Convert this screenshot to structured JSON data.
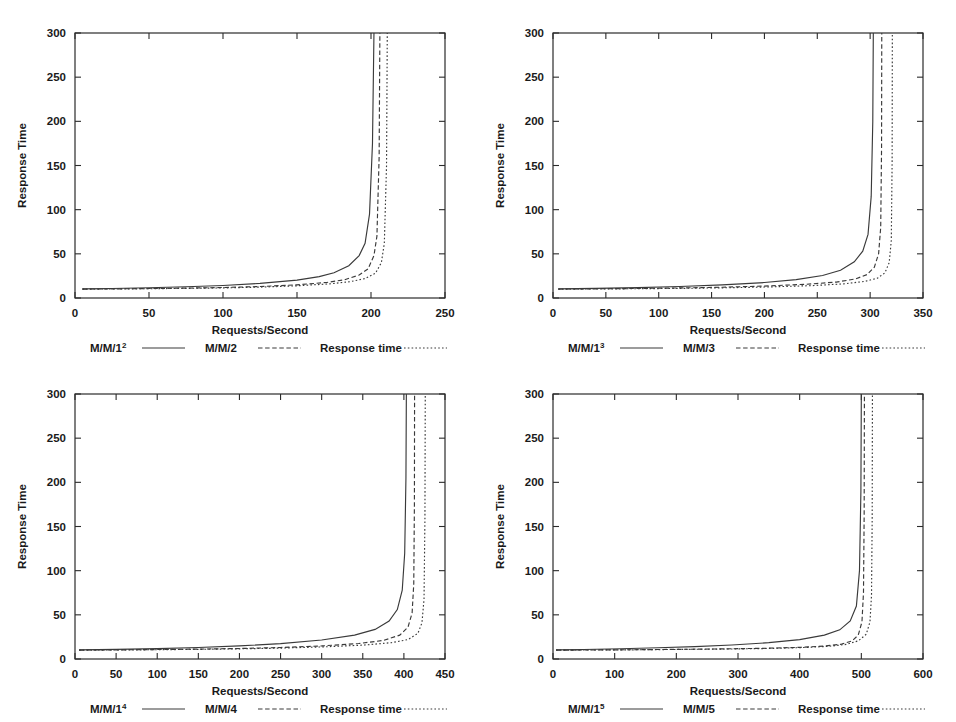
{
  "figure": {
    "panel_count": 4,
    "background": "#ffffff",
    "ink_color": "#2b2b2b"
  },
  "chart_data": [
    {
      "type": "line",
      "title": "",
      "panel_id": "panel-1",
      "xlabel": "Requests/Second",
      "ylabel": "Response Time",
      "xlim": [
        0,
        250
      ],
      "ylim": [
        0,
        300
      ],
      "xticks": [
        0,
        50,
        100,
        150,
        200,
        250
      ],
      "yticks": [
        0,
        50,
        100,
        150,
        200,
        250,
        300
      ],
      "grid": false,
      "legend_position": "below",
      "series": [
        {
          "name": "M/M/1",
          "superscript": "2",
          "label": "M/M/1²",
          "style": "solid",
          "asymptote_x": 202,
          "baseline_y": 10,
          "x": [
            5,
            25,
            50,
            75,
            100,
            125,
            150,
            165,
            175,
            185,
            192,
            196,
            199,
            201,
            202
          ],
          "y": [
            10.3,
            10.8,
            11.6,
            12.7,
            14.2,
            16.5,
            20.3,
            24.2,
            28.5,
            36.5,
            48.0,
            62.0,
            95.0,
            175.0,
            300.0
          ]
        },
        {
          "name": "M/M/2",
          "superscript": "",
          "label": "M/M/2",
          "style": "dashed",
          "asymptote_x": 206,
          "baseline_y": 10,
          "x": [
            5,
            25,
            50,
            75,
            100,
            125,
            150,
            170,
            182,
            192,
            198,
            202,
            204,
            205.5,
            206
          ],
          "y": [
            10.1,
            10.3,
            10.7,
            11.2,
            11.9,
            13.0,
            14.9,
            17.6,
            20.6,
            26.0,
            33.0,
            48.0,
            70.0,
            160.0,
            300.0
          ]
        },
        {
          "name": "Response time",
          "superscript": "",
          "label": "Response time",
          "style": "dotted",
          "asymptote_x": 211,
          "baseline_y": 10,
          "x": [
            5,
            25,
            50,
            75,
            100,
            125,
            150,
            172,
            186,
            196,
            203,
            207,
            209,
            210.5,
            211
          ],
          "y": [
            10.0,
            10.2,
            10.5,
            10.9,
            11.4,
            12.3,
            13.8,
            16.0,
            18.5,
            22.0,
            28.0,
            40.0,
            62.0,
            150.0,
            300.0
          ]
        }
      ]
    },
    {
      "type": "line",
      "title": "",
      "panel_id": "panel-2",
      "xlabel": "Requests/Second",
      "ylabel": "Response Time",
      "xlim": [
        0,
        350
      ],
      "ylim": [
        0,
        300
      ],
      "xticks": [
        0,
        50,
        100,
        150,
        200,
        250,
        300,
        350
      ],
      "yticks": [
        0,
        50,
        100,
        150,
        200,
        250,
        300
      ],
      "grid": false,
      "legend_position": "below",
      "series": [
        {
          "name": "M/M/1",
          "superscript": "3",
          "label": "M/M/1³",
          "style": "solid",
          "asymptote_x": 303,
          "baseline_y": 10,
          "x": [
            5,
            40,
            80,
            120,
            160,
            200,
            230,
            255,
            272,
            285,
            293,
            298,
            301,
            302.5,
            303
          ],
          "y": [
            10.3,
            10.9,
            11.8,
            13.0,
            14.8,
            17.5,
            20.8,
            25.5,
            31.5,
            41.0,
            53.0,
            72.0,
            115.0,
            200.0,
            300.0
          ]
        },
        {
          "name": "M/M/3",
          "superscript": "",
          "label": "M/M/3",
          "style": "dashed",
          "asymptote_x": 311,
          "baseline_y": 10,
          "x": [
            5,
            40,
            80,
            120,
            160,
            200,
            240,
            268,
            286,
            297,
            304,
            308,
            310,
            310.8,
            311
          ],
          "y": [
            10.1,
            10.4,
            10.8,
            11.4,
            12.2,
            13.5,
            15.6,
            18.0,
            21.5,
            26.5,
            35.0,
            50.0,
            80.0,
            170.0,
            300.0
          ]
        },
        {
          "name": "Response time",
          "superscript": "",
          "label": "Response time",
          "style": "dotted",
          "asymptote_x": 321,
          "baseline_y": 10,
          "x": [
            5,
            40,
            80,
            120,
            160,
            200,
            245,
            275,
            295,
            307,
            314,
            318,
            320,
            320.8,
            321
          ],
          "y": [
            10.0,
            10.2,
            10.5,
            10.9,
            11.5,
            12.4,
            14.0,
            16.0,
            18.8,
            22.5,
            28.5,
            40.0,
            65.0,
            155.0,
            300.0
          ]
        }
      ]
    },
    {
      "type": "line",
      "title": "",
      "panel_id": "panel-3",
      "xlabel": "Requests/Second",
      "ylabel": "Response Time",
      "xlim": [
        0,
        450
      ],
      "ylim": [
        0,
        300
      ],
      "xticks": [
        0,
        50,
        100,
        150,
        200,
        250,
        300,
        350,
        400,
        450
      ],
      "yticks": [
        0,
        50,
        100,
        150,
        200,
        250,
        300
      ],
      "grid": false,
      "legend_position": "below",
      "series": [
        {
          "name": "M/M/1",
          "superscript": "4",
          "label": "M/M/1⁴",
          "style": "solid",
          "asymptote_x": 403,
          "baseline_y": 10,
          "x": [
            5,
            50,
            100,
            150,
            200,
            250,
            300,
            340,
            365,
            382,
            392,
            398,
            401,
            402.5,
            403
          ],
          "y": [
            10.3,
            10.9,
            11.8,
            13.0,
            14.8,
            17.4,
            21.5,
            27.0,
            33.5,
            43.0,
            56.0,
            78.0,
            120.0,
            205.0,
            300.0
          ]
        },
        {
          "name": "M/M/4",
          "superscript": "",
          "label": "M/M/4",
          "style": "dashed",
          "asymptote_x": 413,
          "baseline_y": 10,
          "x": [
            5,
            50,
            100,
            150,
            200,
            250,
            300,
            345,
            375,
            395,
            405,
            410,
            412,
            412.8,
            413
          ],
          "y": [
            10.1,
            10.3,
            10.7,
            11.2,
            11.9,
            13.0,
            14.8,
            17.5,
            21.0,
            27.0,
            36.0,
            52.0,
            85.0,
            175.0,
            300.0
          ]
        },
        {
          "name": "Response time",
          "superscript": "",
          "label": "Response time",
          "style": "dotted",
          "asymptote_x": 426,
          "baseline_y": 10,
          "x": [
            5,
            50,
            100,
            150,
            200,
            250,
            305,
            352,
            385,
            405,
            417,
            422,
            424.5,
            425.6,
            426
          ],
          "y": [
            10.0,
            10.2,
            10.5,
            10.9,
            11.5,
            12.3,
            13.8,
            15.8,
            18.5,
            22.0,
            29.0,
            41.0,
            68.0,
            160.0,
            300.0
          ]
        }
      ]
    },
    {
      "type": "line",
      "title": "",
      "panel_id": "panel-4",
      "xlabel": "Requests/Second",
      "ylabel": "Response Time",
      "xlim": [
        0,
        600
      ],
      "ylim": [
        0,
        300
      ],
      "xticks": [
        0,
        100,
        200,
        300,
        400,
        500,
        600
      ],
      "yticks": [
        0,
        50,
        100,
        150,
        200,
        250,
        300
      ],
      "grid": false,
      "legend_position": "below",
      "series": [
        {
          "name": "M/M/1",
          "superscript": "5",
          "label": "M/M/1⁵",
          "style": "solid",
          "asymptote_x": 500,
          "baseline_y": 10,
          "x": [
            5,
            50,
            110,
            170,
            230,
            290,
            350,
            400,
            440,
            465,
            482,
            492,
            497,
            499.3,
            500
          ],
          "y": [
            10.3,
            10.8,
            11.6,
            12.7,
            14.0,
            15.8,
            18.5,
            22.0,
            27.0,
            33.0,
            43.0,
            60.0,
            100.0,
            190.0,
            300.0
          ]
        },
        {
          "name": "M/M/5",
          "superscript": "",
          "label": "M/M/5",
          "style": "dashed",
          "asymptote_x": 505,
          "baseline_y": 10,
          "x": [
            5,
            60,
            130,
            200,
            270,
            340,
            400,
            440,
            468,
            485,
            495,
            501,
            503.5,
            504.6,
            505
          ],
          "y": [
            10.0,
            10.2,
            10.5,
            10.9,
            11.4,
            12.1,
            13.2,
            14.6,
            16.8,
            20.5,
            27.0,
            42.0,
            75.0,
            165.0,
            300.0
          ]
        },
        {
          "name": "Response time",
          "superscript": "",
          "label": "Response time",
          "style": "dotted",
          "asymptote_x": 518,
          "baseline_y": 10,
          "x": [
            5,
            60,
            130,
            200,
            270,
            340,
            400,
            445,
            475,
            495,
            508,
            514,
            516.5,
            517.6,
            518
          ],
          "y": [
            10.0,
            10.2,
            10.4,
            10.8,
            11.2,
            11.8,
            12.8,
            14.2,
            16.5,
            20.5,
            28.0,
            42.0,
            72.0,
            160.0,
            300.0
          ]
        }
      ]
    }
  ]
}
